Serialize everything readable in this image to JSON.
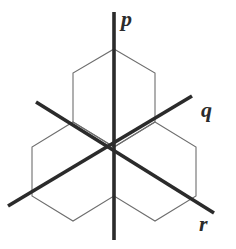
{
  "figure": {
    "type": "line-diagram",
    "width": 236,
    "height": 249,
    "background_color": "#ffffff",
    "center": {
      "x": 114,
      "y": 147
    },
    "styles": {
      "axis_color": "#2b2b2b",
      "axis_stroke_width": 3.6,
      "hexagon_color": "#6e6e6e",
      "hexagon_stroke_width": 1.1,
      "label_color": "#2b2b2b",
      "label_font_size_px": 22
    },
    "axes": [
      {
        "id": "p",
        "label": "p",
        "orientation": "vertical",
        "direction_degrees": 90,
        "start": {
          "x": 114,
          "y": 240
        },
        "end": {
          "x": 114,
          "y": 12
        },
        "label_position": {
          "x": 121,
          "y": 8
        }
      },
      {
        "id": "q",
        "label": "q",
        "orientation": "diagonal-up-right",
        "direction_degrees": 30,
        "start": {
          "x": 8,
          "y": 206
        },
        "end": {
          "x": 192,
          "y": 96
        },
        "label_position": {
          "x": 201,
          "y": 99
        }
      },
      {
        "id": "r",
        "label": "r",
        "orientation": "diagonal-down-right",
        "direction_degrees": -30,
        "start": {
          "x": 36,
          "y": 102
        },
        "end": {
          "x": 214,
          "y": 213
        },
        "label_position": {
          "x": 199,
          "y": 213
        }
      }
    ],
    "hexagons": [
      {
        "id": "hexagon-top",
        "position": "top",
        "center": {
          "x": 114,
          "y": 98
        },
        "vertices": [
          {
            "x": 114,
            "y": 49
          },
          {
            "x": 155,
            "y": 73
          },
          {
            "x": 155,
            "y": 122
          },
          {
            "x": 114,
            "y": 147
          },
          {
            "x": 73,
            "y": 122
          },
          {
            "x": 73,
            "y": 73
          }
        ]
      },
      {
        "id": "hexagon-lower-left",
        "position": "lower-left",
        "center": {
          "x": 73,
          "y": 171
        },
        "vertices": [
          {
            "x": 73,
            "y": 122
          },
          {
            "x": 114,
            "y": 147
          },
          {
            "x": 114,
            "y": 196
          },
          {
            "x": 73,
            "y": 221
          },
          {
            "x": 32,
            "y": 196
          },
          {
            "x": 32,
            "y": 147
          }
        ]
      },
      {
        "id": "hexagon-lower-right",
        "position": "lower-right",
        "center": {
          "x": 155,
          "y": 171
        },
        "vertices": [
          {
            "x": 155,
            "y": 122
          },
          {
            "x": 196,
            "y": 147
          },
          {
            "x": 196,
            "y": 196
          },
          {
            "x": 155,
            "y": 221
          },
          {
            "x": 114,
            "y": 196
          },
          {
            "x": 114,
            "y": 147
          }
        ]
      }
    ]
  }
}
